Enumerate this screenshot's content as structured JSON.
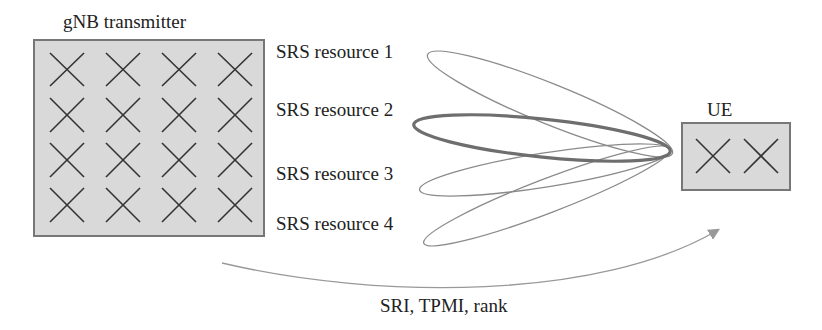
{
  "diagram": {
    "transmitter": {
      "title": "gNB transmitter",
      "antenna_rows": 4,
      "antenna_cols": 4,
      "fill": "#d9d9d9",
      "border": "#777777"
    },
    "receiver": {
      "title": "UE",
      "antenna_count": 2,
      "fill": "#d9d9d9",
      "border": "#777777"
    },
    "beams": [
      {
        "label": "SRS resource 1",
        "highlighted": false
      },
      {
        "label": "SRS resource 2",
        "highlighted": true
      },
      {
        "label": "SRS resource 3",
        "highlighted": false
      },
      {
        "label": "SRS resource 4",
        "highlighted": false
      }
    ],
    "feedback": {
      "label": "SRI, TPMI, rank",
      "direction": "gNB to UE"
    },
    "colors": {
      "beam": "#8a8a8a",
      "beam_highlight": "#6e6e6e",
      "cross": "#333333",
      "arrow": "#999999"
    }
  }
}
